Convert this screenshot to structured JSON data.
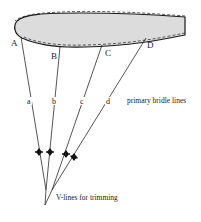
{
  "diagram": {
    "type": "kite-bridle-diagram",
    "colors": {
      "profile_fill": "#dcdcdc",
      "outline": "#1a1a1a",
      "lines": "#2a2a2a"
    },
    "profile": {
      "shape": "airfoil",
      "outline": "solid",
      "secondary_outline": "dashed"
    },
    "attachment_points": [
      {
        "label": "A"
      },
      {
        "label": "B"
      },
      {
        "label": "C"
      },
      {
        "label": "D"
      }
    ],
    "bridle_lines": [
      {
        "label": "a"
      },
      {
        "label": "b"
      },
      {
        "label": "c"
      },
      {
        "label": "d"
      }
    ],
    "annotations": {
      "primary": "primary bridle lines",
      "vlines": "V-lines for trimming"
    }
  }
}
